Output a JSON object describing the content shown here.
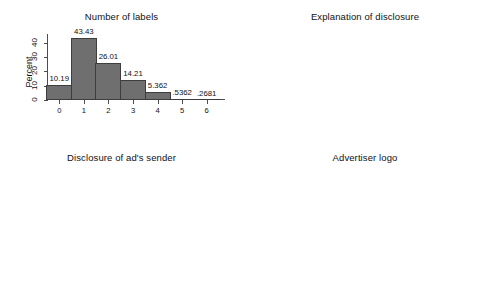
{
  "figure": {
    "background": "#ffffff",
    "bar_fill": "#6f6f6f",
    "bar_stroke": "#3d3d3d",
    "axis_color": "#4d4d4d",
    "text_color": "#111111"
  },
  "chart_data": [
    {
      "type": "bar",
      "title": "Number of labels",
      "xlabel": "",
      "ylabel": "Percent",
      "categories": [
        "0",
        "1",
        "2",
        "3",
        "4",
        "5",
        "6"
      ],
      "values": [
        10.19,
        43.43,
        26.01,
        14.21,
        5.362,
        0.5362,
        0.2681
      ],
      "value_labels": [
        "10.19",
        "43.43",
        "26.01",
        "14.21",
        "5.362",
        ".5362",
        ".2681"
      ],
      "yticks": [
        0,
        10,
        20,
        30,
        40
      ],
      "ytick_labels": [
        "0",
        "10",
        "20",
        "30",
        "40"
      ],
      "ylim": [
        0,
        46
      ],
      "grid": false,
      "legend": null,
      "style": "histogram-contiguous"
    },
    {
      "type": "bar",
      "title": "Explanation of disclosure",
      "xlabel": "",
      "ylabel": "Percent",
      "categories": [
        "No",
        "Yes, link to an\nexplanation page",
        "Yes, explanation\nin the same page"
      ],
      "values": [
        63.54,
        3.485,
        32.98
      ],
      "value_labels": [
        "63.54",
        "3.485",
        "32.98"
      ],
      "yticks": [
        0,
        20,
        40,
        60
      ],
      "ytick_labels": [
        "0",
        "20",
        "40",
        "60"
      ],
      "ylim": [
        0,
        68
      ],
      "grid": false,
      "legend": null,
      "style": "histogram-contiguous"
    },
    {
      "type": "bar",
      "title": "Disclosure of ad's sender",
      "xlabel": "",
      "ylabel": "Percent",
      "categories": [
        "Not explicit",
        "Explicit"
      ],
      "values": [
        55.5,
        44.5
      ],
      "value_labels": [
        "55.5",
        "44.5"
      ],
      "yticks": [
        0,
        20,
        40,
        60
      ],
      "ytick_labels": [
        "0",
        "20",
        "40",
        "60"
      ],
      "ylim": [
        0,
        62
      ],
      "grid": false,
      "legend": null,
      "style": "histogram-contiguous"
    },
    {
      "type": "bar",
      "title": "Advertiser logo",
      "xlabel": "",
      "ylabel": "Percent",
      "categories": [
        "Not present",
        "Present"
      ],
      "values": [
        32.17,
        67.83
      ],
      "value_labels": [
        "32.17",
        "67.83"
      ],
      "yticks": [
        0,
        20,
        40,
        60,
        80
      ],
      "ytick_labels": [
        "0",
        "20",
        "40",
        "60",
        "80"
      ],
      "ylim": [
        0,
        84
      ],
      "grid": false,
      "legend": null,
      "style": "histogram-contiguous"
    }
  ]
}
